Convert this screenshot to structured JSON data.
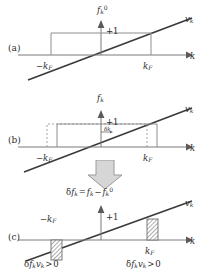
{
  "figure": {
    "background_color": "#ffffff",
    "line_color": "#3a3a3a",
    "axis_color": "#6b6b6b",
    "hatch_color": "#8a8a8a",
    "arrow_fill": "#d4d4d4"
  },
  "panels": [
    {
      "id": "a",
      "letter": "(a)",
      "vertical_axis_label": "f",
      "vertical_axis_sub": "k",
      "vertical_axis_sup": "0",
      "amplitude_label": "+1",
      "horizontal_axis_label": "k",
      "velocity_label": "v",
      "velocity_sub": "k",
      "left_tick_label": "−k",
      "left_tick_sub": "F",
      "right_tick_label": "k",
      "right_tick_sub": "F",
      "description": "Equilibrium distribution: symmetric box from -kF to +kF, height +1, with linear velocity line v_k through origin."
    },
    {
      "id": "b",
      "letter": "(b)",
      "vertical_axis_label": "f",
      "vertical_axis_sub": "k",
      "vertical_axis_sup": "",
      "amplitude_label": "+1",
      "horizontal_axis_label": "k",
      "velocity_label": "v",
      "velocity_sub": "k",
      "left_tick_label": "−k",
      "left_tick_sub": "F",
      "right_tick_label": "k",
      "right_tick_sub": "F",
      "shift_label": "δk",
      "description": "Displaced distribution: box shifted to the right by delta-k; dashed outline marks equilibrium position."
    },
    {
      "id": "c",
      "letter": "(c)",
      "vertical_axis_label": "δf",
      "vertical_axis_sub": "k",
      "title_expression": "δf_k = f_k − f_k⁰",
      "amplitude_label": "+1",
      "horizontal_axis_label": "k",
      "velocity_label": "v",
      "velocity_sub": "k",
      "left_tick_label": "−k",
      "left_tick_sub": "F",
      "right_tick_label": "k",
      "right_tick_sub": "F",
      "left_annotation": "δf_k v_k > 0",
      "right_annotation": "δf_k v_k > 0",
      "description": "Difference distribution: hatched negative block near -kF below axis, hatched positive block near +kF above axis."
    }
  ],
  "flow_arrow": {
    "name": "down-arrow",
    "direction": "down",
    "fill": "#d6d6d6"
  }
}
